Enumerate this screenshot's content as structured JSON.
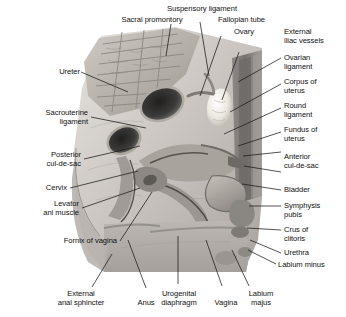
{
  "figure": {
    "style": "grayscale medical illustration with leader lines to labels",
    "colors": {
      "background": "#ffffff",
      "label_text": "#111111",
      "leader_line": "#1a1a1a",
      "tissue_light": "#d9d5d0",
      "tissue_mid": "#b3aeaa",
      "tissue_dark": "#807b77",
      "cavity_dark": "#30302e",
      "ovary_highlight": "#f2efe9",
      "muscle_block": "#9c9894"
    }
  },
  "labels": {
    "sacral_promontory": "Sacral promontory",
    "suspensory_ligament": "Suspensory ligament",
    "fallopian_tube": "Fallopian tube",
    "ovary": "Ovary",
    "external_iliac_vessels": "External\niliac vessels",
    "ovarian_ligament": "Ovarian\nligament",
    "corpus_of_uterus": "Corpus of\nuterus",
    "round_ligament": "Round\nligament",
    "fundus_of_uterus": "Fundus of\nuterus",
    "anterior_cul_de_sac": "Anterior\ncul-de-sac",
    "bladder": "Bladder",
    "symphysis_pubis": "Symphysis\npubis",
    "crus_of_clitoris": "Crus of\nclitoris",
    "urethra": "Urethra",
    "labium_minus": "Labium minus",
    "ureter": "Ureter",
    "sacrouterine_ligament": "Sacrouterine\nligament",
    "posterior_cul_de_sac": "Posterior\ncul-de-sac",
    "cervix": "Cervix",
    "levator_ani_muscle": "Levator\nani muscle",
    "fornix_of_vagina": "Fornix of vagina",
    "external_anal_sphincter": "External\nanal sphincter",
    "anus": "Anus",
    "urogenital_diaphragm": "Urogenital\ndiaphragm",
    "vagina": "Vagina",
    "labium_majus": "Labium\nmajus"
  }
}
